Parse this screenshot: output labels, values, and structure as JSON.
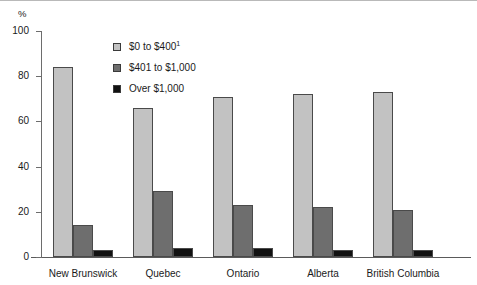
{
  "chart_data": {
    "type": "bar",
    "title": "",
    "subtitle": "",
    "xlabel": "",
    "ylabel": "%",
    "ylim": [
      0,
      100
    ],
    "yticks": [
      0,
      20,
      40,
      60,
      80,
      100
    ],
    "grid": false,
    "legend_position": "inside-top-left",
    "categories": [
      "New Brunswick",
      "Quebec",
      "Ontario",
      "Alberta",
      "British Columbia"
    ],
    "series": [
      {
        "name": "$0 to $400",
        "footnote_marker": "1",
        "color": "#c2c2c2",
        "values": [
          84,
          66,
          71,
          72,
          73
        ]
      },
      {
        "name": "$401 to $1,000",
        "footnote_marker": "",
        "color": "#6e6e6e",
        "values": [
          14,
          29,
          23,
          22,
          21
        ]
      },
      {
        "name": "Over $1,000",
        "footnote_marker": "",
        "color": "#111111",
        "values": [
          3,
          4,
          4,
          3,
          3
        ]
      }
    ]
  },
  "axis": {
    "unit_label": "%"
  },
  "legend": {
    "items": [
      {
        "label": "$0 to $400",
        "sup": "1"
      },
      {
        "label": "$401 to $1,000",
        "sup": ""
      },
      {
        "label": "Over $1,000",
        "sup": ""
      }
    ]
  }
}
